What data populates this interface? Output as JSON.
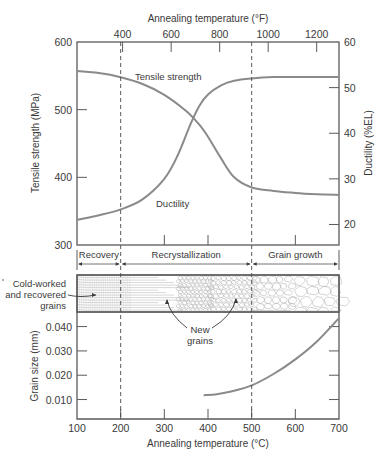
{
  "chart_data": [
    {
      "id": "properties",
      "type": "line",
      "title": "",
      "xlabel": "Annealing temperature (°C)",
      "x2label": "Annealing temperature (°F)",
      "ylabel": "Tensile strength (MPa)",
      "y2label": "Ductility (%EL)",
      "xlim": [
        100,
        700
      ],
      "ylim": [
        300,
        600
      ],
      "y2lim": [
        15.5,
        60
      ],
      "x2_ticks": [
        {
          "label": "400",
          "c": 204.4
        },
        {
          "label": "600",
          "c": 315.6
        },
        {
          "label": "800",
          "c": 426.7
        },
        {
          "label": "1000",
          "c": 537.8
        },
        {
          "label": "1200",
          "c": 648.9
        }
      ],
      "y_ticks": [
        "600",
        "500",
        "400",
        "300"
      ],
      "y2_ticks": [
        "60",
        "50",
        "40",
        "30",
        "20"
      ],
      "grid": false,
      "series": [
        {
          "name": "Tensile strength",
          "axis": "left",
          "x": [
            100,
            150,
            200,
            250,
            300,
            350,
            380,
            400,
            430,
            460,
            500,
            550,
            600,
            650,
            700
          ],
          "values": [
            557,
            554,
            548,
            538,
            522,
            498,
            478,
            460,
            428,
            400,
            385,
            380,
            377,
            375,
            374
          ]
        },
        {
          "name": "Ductility",
          "axis": "right",
          "x": [
            100,
            150,
            200,
            250,
            300,
            330,
            360,
            380,
            400,
            430,
            460,
            500,
            550,
            600,
            650,
            700
          ],
          "values": [
            21,
            22,
            23.3,
            25.5,
            30,
            35,
            42,
            46,
            48.5,
            50.5,
            51.5,
            52,
            52.3,
            52.3,
            52.3,
            52.3
          ]
        }
      ],
      "annotations": [
        {
          "text": "Tensile strength",
          "x": 250,
          "y": 547
        },
        {
          "text": "Ductility",
          "x": 285,
          "y": 383
        }
      ]
    },
    {
      "id": "grain_size",
      "type": "line",
      "title": "",
      "xlabel": "Annealing temperature (°C)",
      "ylabel": "Grain size (mm)",
      "xlim": [
        100,
        700
      ],
      "ylim": [
        0.002,
        0.046
      ],
      "x_ticks": [
        "100",
        "200",
        "300",
        "400",
        "500",
        "600",
        "700"
      ],
      "y_ticks": [
        "0.040",
        "0.030",
        "0.020",
        "0.010"
      ],
      "grid": false,
      "series": [
        {
          "name": "Grain size",
          "x": [
            390,
            420,
            450,
            500,
            550,
            600,
            650,
            700
          ],
          "values": [
            0.0118,
            0.0122,
            0.0132,
            0.0158,
            0.0205,
            0.0265,
            0.034,
            0.0435
          ]
        }
      ]
    }
  ],
  "stages": [
    {
      "label": "Recovery",
      "from": 100,
      "to": 200
    },
    {
      "label": "Recrystallization",
      "from": 200,
      "to": 500
    },
    {
      "label": "Grain growth",
      "from": 500,
      "to": 700
    }
  ],
  "microstructure": {
    "label_cold": [
      "Cold-worked",
      "and recovered",
      "grains"
    ],
    "label_new": [
      "New",
      "grains"
    ]
  },
  "colors": {
    "curve": "#8a8a8a",
    "frame": "#5a5a5a",
    "text": "#3a3a3a",
    "grain_line": "#a8a8a8"
  }
}
